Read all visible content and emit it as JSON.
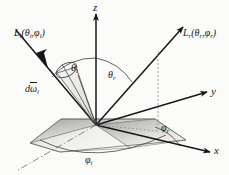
{
  "figure": {
    "background_color": "#fbfbfa",
    "ink_color": "#171717",
    "surface_fill_light": "#e9e9e7",
    "surface_fill_dark": "#9a9a98"
  },
  "axes": {
    "z": "z",
    "y": "y",
    "x": "x"
  },
  "rays": {
    "incident": {
      "label_L": "L",
      "label_sub": "i",
      "label_args": "(θ",
      "full": "L_i(θ_i,φ_i)"
    },
    "reflected": {
      "label_L": "L",
      "label_sub": "r",
      "full": "L_r(θ_r,φ_r)"
    }
  },
  "labels": {
    "L_i": {
      "base": "L",
      "sub1": "i",
      "open": "(θ",
      "sub2": "i",
      "comma": ",φ",
      "sub3": "i",
      "close": ")"
    },
    "L_r": {
      "base": "L",
      "sub1": "r",
      "open": "(θ",
      "sub2": "r",
      "comma": ",φ",
      "sub3": "r",
      "close": ")"
    },
    "theta_i": {
      "base": "θ",
      "sub": "i"
    },
    "theta_r": {
      "base": "θ",
      "sub": "r"
    },
    "phi_i": {
      "base": "φ",
      "sub": "i"
    },
    "phi_r": {
      "base": "φ",
      "sub": "r"
    },
    "d_omega_i": {
      "d": "d",
      "omega": "ω",
      "sub": "i"
    }
  }
}
